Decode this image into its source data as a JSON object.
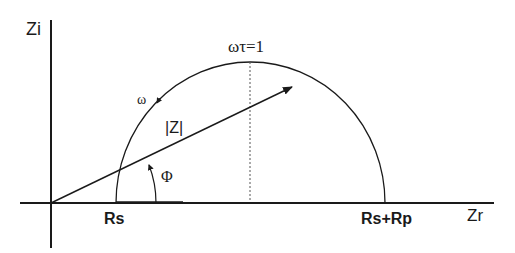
{
  "diagram": {
    "axes": {
      "y_label": "Zi",
      "x_label": "Zr"
    },
    "labels": {
      "omega_tau": "ωτ=1",
      "omega": "ω",
      "magnitude": "|Z|",
      "phase": "Φ",
      "rs": "Rs",
      "rs_rp": "Rs+Rp"
    },
    "colors": {
      "line": "#1a1a1a",
      "dashed": "#555555",
      "background": "#ffffff"
    }
  }
}
